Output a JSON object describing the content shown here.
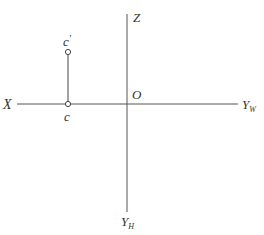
{
  "diagram": {
    "type": "projection-axes",
    "axes": {
      "x_label": "X",
      "z_label": "Z",
      "origin_label": "O",
      "yw_label": "Y",
      "yw_subscript": "W",
      "yh_label": "Y",
      "yh_subscript": "H"
    },
    "points": [
      {
        "label": "c",
        "prime": "",
        "position": "on X axis"
      },
      {
        "label": "c",
        "prime": "′",
        "position": "above X axis"
      }
    ],
    "colors": {
      "line": "#555555",
      "text": "#333333",
      "background": "#ffffff"
    }
  }
}
